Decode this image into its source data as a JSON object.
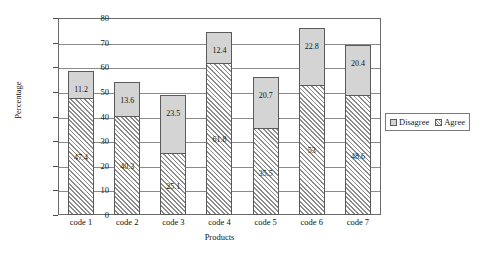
{
  "chart_data": {
    "type": "bar",
    "title": "",
    "xlabel": "Products",
    "ylabel": "Percentage",
    "ylim": [
      0,
      80
    ],
    "ytick_step": 10,
    "yticks": [
      80,
      70,
      60,
      50,
      40,
      30,
      20,
      10,
      0
    ],
    "grid": true,
    "stacked": true,
    "legend_position": "right",
    "categories": [
      "code 1",
      "code 2",
      "code 3",
      "code 4",
      "code 5",
      "code 6",
      "code 7"
    ],
    "series": [
      {
        "name": "Agree",
        "style": "hatched",
        "color": "#c9c9c9",
        "values": [
          47.4,
          40.3,
          25.1,
          61.8,
          35.5,
          53,
          48.6
        ]
      },
      {
        "name": "Disagree",
        "style": "solid",
        "color": "#d4d4d4",
        "values": [
          11.2,
          13.6,
          23.5,
          12.4,
          20.7,
          22.8,
          20.4
        ]
      }
    ],
    "totals": [
      58.6,
      53.9,
      48.6,
      74.2,
      56.2,
      75.8,
      69.0
    ]
  },
  "legend": {
    "items": [
      {
        "label": "Disagree",
        "swatch": "disagree"
      },
      {
        "label": "Agree",
        "swatch": "agree"
      }
    ]
  }
}
